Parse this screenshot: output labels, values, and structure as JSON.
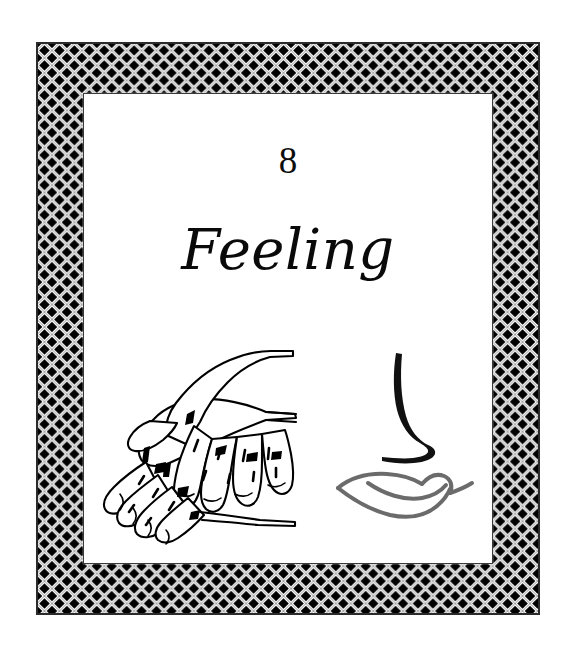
{
  "page": {
    "background_color": "#ffffff",
    "kind": "book-chapter-opening-page"
  },
  "frame": {
    "name": "woven-lattice-border",
    "pattern": "basket-weave-diagonal-lattice",
    "band_color_dark": "#000000",
    "band_color_light": "#ffffff",
    "outline_color": "#2b2b2b",
    "cell_size_px": 15,
    "border_thickness_px": 48
  },
  "content": {
    "chapter_number": "8",
    "chapter_title": "Feeling",
    "title_style": "italic-script-serif",
    "text_color": "#0a0a0a"
  },
  "illustrations": [
    {
      "id": "hands",
      "name": "two-hands-touching-illustration",
      "description": "Line drawing of one hand resting on top of another hand, palm down, fingers interlaced and extended to the left",
      "stroke_color": "#000000",
      "fill_color": "#ffffff",
      "style": "black-line-art"
    },
    {
      "id": "face",
      "name": "nose-and-lips-illustration",
      "description": "Minimal profile drawing of a nose as a single brush curve above a pair of stylised lips",
      "nose_stroke_color": "#111111",
      "lips_stroke_color": "#6b6b6b",
      "style": "brushstroke-line-art"
    }
  ],
  "senses_depicted": [
    "touch",
    "smell",
    "taste"
  ]
}
